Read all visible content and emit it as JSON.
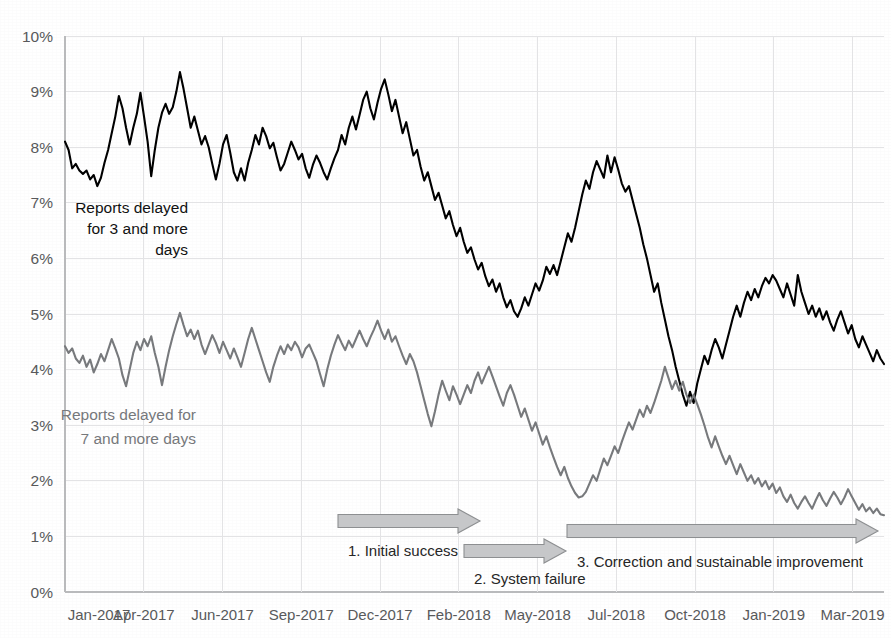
{
  "chart_data": {
    "type": "line",
    "title": "",
    "subtitle": "",
    "xlabel": "",
    "ylabel": "",
    "ylim": [
      0,
      10
    ],
    "ytick_labels": [
      "0%",
      "1%",
      "2%",
      "3%",
      "4%",
      "5%",
      "6%",
      "7%",
      "8%",
      "9%",
      "10%"
    ],
    "ytick_values": [
      0,
      1,
      2,
      3,
      4,
      5,
      6,
      7,
      8,
      9,
      10
    ],
    "grid": true,
    "legend_position": "inline-annotations",
    "x_tick_labels": [
      "Jan-2017",
      "Apr-2017",
      "Jun-2017",
      "Sep-2017",
      "Dec-2017",
      "Feb-2018",
      "May-2018",
      "Jul-2018",
      "Oct-2018",
      "Jan-2019",
      "Mar-2019"
    ],
    "x_tick_positions": [
      0,
      10,
      20,
      30,
      40,
      50,
      60,
      70,
      80,
      90,
      100
    ],
    "xlim": [
      0,
      104
    ],
    "series": [
      {
        "name": "Reports delayed for 3 and more days",
        "color": "#000000",
        "label_text_lines": [
          "Reports delayed",
          "for 3 and more",
          "days"
        ],
        "values": [
          8.1,
          7.95,
          7.62,
          7.7,
          7.58,
          7.52,
          7.58,
          7.42,
          7.5,
          7.3,
          7.45,
          7.72,
          7.95,
          8.25,
          8.55,
          8.92,
          8.7,
          8.35,
          8.05,
          8.35,
          8.6,
          8.98,
          8.55,
          8.1,
          7.48,
          7.95,
          8.35,
          8.62,
          8.78,
          8.6,
          8.72,
          9.0,
          9.35,
          9.05,
          8.7,
          8.35,
          8.55,
          8.3,
          8.05,
          8.2,
          8.0,
          7.7,
          7.42,
          7.7,
          8.05,
          8.22,
          7.9,
          7.55,
          7.4,
          7.62,
          7.4,
          7.72,
          7.95,
          8.22,
          8.05,
          8.35,
          8.2,
          7.98,
          8.08,
          7.82,
          7.58,
          7.7,
          7.9,
          8.1,
          7.95,
          7.78,
          7.88,
          7.62,
          7.45,
          7.68,
          7.85,
          7.72,
          7.55,
          7.42,
          7.62,
          7.8,
          7.95,
          8.22,
          8.05,
          8.35,
          8.55,
          8.32,
          8.58,
          8.85,
          9.0,
          8.7,
          8.5,
          8.8,
          9.05,
          9.22,
          8.95,
          8.65,
          8.85,
          8.55,
          8.25,
          8.45,
          8.15,
          7.85,
          7.95,
          7.65,
          7.4,
          7.55,
          7.3,
          7.05,
          7.18,
          6.95,
          6.72,
          6.85,
          6.6,
          6.4,
          6.55,
          6.3,
          6.1,
          6.2,
          5.98,
          5.8,
          5.92,
          5.68,
          5.5,
          5.62,
          5.4,
          5.55,
          5.3,
          5.12,
          5.25,
          5.05,
          4.95,
          5.1,
          5.3,
          5.15,
          5.35,
          5.55,
          5.42,
          5.6,
          5.85,
          5.72,
          5.88,
          5.7,
          5.95,
          6.2,
          6.45,
          6.3,
          6.55,
          6.85,
          7.15,
          7.4,
          7.25,
          7.55,
          7.75,
          7.6,
          7.45,
          7.85,
          7.55,
          7.82,
          7.6,
          7.35,
          7.2,
          7.3,
          7.05,
          6.8,
          6.55,
          6.25,
          6.0,
          5.7,
          5.4,
          5.55,
          5.2,
          4.9,
          4.6,
          4.35,
          4.05,
          3.8,
          3.55,
          3.35,
          3.6,
          3.4,
          3.75,
          4.0,
          4.25,
          4.1,
          4.35,
          4.55,
          4.4,
          4.2,
          4.45,
          4.7,
          4.95,
          5.15,
          4.95,
          5.2,
          5.4,
          5.25,
          5.45,
          5.3,
          5.5,
          5.65,
          5.55,
          5.7,
          5.6,
          5.45,
          5.3,
          5.55,
          5.35,
          5.15,
          5.7,
          5.4,
          5.2,
          5.0,
          5.15,
          4.95,
          5.1,
          4.9,
          5.05,
          4.85,
          4.7,
          4.9,
          5.05,
          4.85,
          4.65,
          4.8,
          4.55,
          4.4,
          4.6,
          4.45,
          4.3,
          4.15,
          4.35,
          4.2,
          4.1
        ]
      },
      {
        "name": "Reports delayed for 7 and more days",
        "color": "#77797c",
        "label_text_lines": [
          "Reports delayed for",
          "7 and more days"
        ],
        "values": [
          4.42,
          4.3,
          4.38,
          4.2,
          4.12,
          4.25,
          4.05,
          4.18,
          3.95,
          4.1,
          4.28,
          4.15,
          4.35,
          4.55,
          4.38,
          4.2,
          3.9,
          3.7,
          4.0,
          4.3,
          4.5,
          4.35,
          4.55,
          4.42,
          4.6,
          4.3,
          4.05,
          3.72,
          4.05,
          4.35,
          4.6,
          4.82,
          5.02,
          4.8,
          4.6,
          4.72,
          4.55,
          4.7,
          4.45,
          4.28,
          4.45,
          4.62,
          4.48,
          4.3,
          4.5,
          4.35,
          4.2,
          4.38,
          4.22,
          4.05,
          4.3,
          4.55,
          4.75,
          4.55,
          4.35,
          4.15,
          3.95,
          3.78,
          4.05,
          4.25,
          4.42,
          4.28,
          4.45,
          4.35,
          4.5,
          4.4,
          4.22,
          4.38,
          4.45,
          4.3,
          4.15,
          3.92,
          3.7,
          4.0,
          4.25,
          4.45,
          4.62,
          4.48,
          4.35,
          4.52,
          4.4,
          4.55,
          4.7,
          4.55,
          4.42,
          4.58,
          4.72,
          4.88,
          4.7,
          4.55,
          4.72,
          4.5,
          4.6,
          4.42,
          4.25,
          4.1,
          4.28,
          4.15,
          3.95,
          3.7,
          3.45,
          3.2,
          2.98,
          3.25,
          3.55,
          3.8,
          3.62,
          3.45,
          3.7,
          3.55,
          3.38,
          3.55,
          3.72,
          3.58,
          3.8,
          3.95,
          3.75,
          3.9,
          4.05,
          3.88,
          3.7,
          3.52,
          3.35,
          3.58,
          3.72,
          3.55,
          3.35,
          3.15,
          3.3,
          3.1,
          2.9,
          3.05,
          2.85,
          2.65,
          2.8,
          2.6,
          2.42,
          2.25,
          2.1,
          2.25,
          2.05,
          1.9,
          1.78,
          1.7,
          1.72,
          1.8,
          1.95,
          2.1,
          2.0,
          2.2,
          2.4,
          2.28,
          2.45,
          2.62,
          2.5,
          2.7,
          2.88,
          3.05,
          2.92,
          3.1,
          3.28,
          3.15,
          3.35,
          3.22,
          3.4,
          3.6,
          3.8,
          4.05,
          3.85,
          3.65,
          3.8,
          3.62,
          3.78,
          3.55,
          3.4,
          3.55,
          3.38,
          3.2,
          3.0,
          2.78,
          2.6,
          2.8,
          2.62,
          2.45,
          2.3,
          2.45,
          2.28,
          2.12,
          2.3,
          2.15,
          2.0,
          2.1,
          1.95,
          2.05,
          1.9,
          2.0,
          1.85,
          1.95,
          1.78,
          1.88,
          1.72,
          1.62,
          1.75,
          1.6,
          1.5,
          1.62,
          1.72,
          1.6,
          1.5,
          1.65,
          1.78,
          1.65,
          1.55,
          1.68,
          1.8,
          1.7,
          1.58,
          1.7,
          1.85,
          1.72,
          1.6,
          1.48,
          1.58,
          1.45,
          1.52,
          1.42,
          1.5,
          1.4,
          1.38
        ]
      }
    ],
    "annotations": [
      {
        "id": "phase-1",
        "label": "1. Initial success",
        "arrow_start_x": 338,
        "arrow_end_x": 480,
        "arrow_y": 521,
        "label_x": 348,
        "label_y": 556
      },
      {
        "id": "phase-2",
        "label": "2. System failure",
        "arrow_start_x": 464,
        "arrow_end_x": 566,
        "arrow_y": 551,
        "label_x": 474,
        "label_y": 584
      },
      {
        "id": "phase-3",
        "label": "3. Correction and sustainable improvement",
        "arrow_start_x": 567,
        "arrow_end_x": 878,
        "arrow_y": 531,
        "label_x": 577,
        "label_y": 567
      }
    ]
  }
}
